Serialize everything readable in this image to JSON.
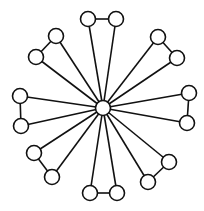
{
  "diagram": {
    "type": "graph",
    "style": {
      "background": "#ffffff",
      "stroke": "#111111",
      "node_fill": "#ffffff",
      "node_radius": 7.5
    },
    "hub": {
      "id": "hub",
      "x": 103,
      "y": 108
    },
    "pairs": [
      {
        "name": "top",
        "a": {
          "x": 88,
          "y": 19
        },
        "b": {
          "x": 116,
          "y": 19
        }
      },
      {
        "name": "upper-right",
        "a": {
          "x": 158,
          "y": 37
        },
        "b": {
          "x": 177,
          "y": 58
        }
      },
      {
        "name": "right",
        "a": {
          "x": 189,
          "y": 93
        },
        "b": {
          "x": 187,
          "y": 123
        }
      },
      {
        "name": "lower-right",
        "a": {
          "x": 169,
          "y": 162
        },
        "b": {
          "x": 148,
          "y": 182
        }
      },
      {
        "name": "bottom",
        "a": {
          "x": 90,
          "y": 193
        },
        "b": {
          "x": 117,
          "y": 193
        }
      },
      {
        "name": "lower-left",
        "a": {
          "x": 34,
          "y": 153
        },
        "b": {
          "x": 52,
          "y": 177
        }
      },
      {
        "name": "left",
        "a": {
          "x": 20,
          "y": 96
        },
        "b": {
          "x": 21,
          "y": 126
        }
      },
      {
        "name": "upper-left",
        "a": {
          "x": 56,
          "y": 36
        },
        "b": {
          "x": 36,
          "y": 57
        }
      }
    ],
    "node_count": 17,
    "edge_count": 24
  }
}
